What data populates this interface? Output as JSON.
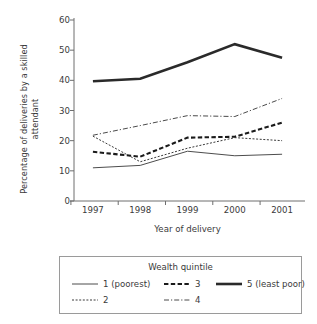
{
  "chart_data": {
    "type": "line",
    "title": "",
    "xlabel": "Year of delivery",
    "ylabel": "Percentage of deliveries by a skilled attendant",
    "ylabel_line1": "Percentage of deliveries by a skilled",
    "ylabel_line2": "attendant",
    "categories": [
      "1997",
      "1998",
      "1999",
      "2000",
      "2001"
    ],
    "x": [
      1997,
      1998,
      1999,
      2000,
      2001
    ],
    "xlim": [
      1996.6,
      2001.4
    ],
    "ylim": [
      0,
      60
    ],
    "yticks": [
      0,
      10,
      20,
      30,
      40,
      50,
      60
    ],
    "ytick_labels": [
      "0",
      "10",
      "20",
      "30",
      "40",
      "50",
      "60"
    ],
    "grid": false,
    "legend_position": "below",
    "legend_title": "Wealth quintile",
    "series": [
      {
        "name": "1 (poorest)",
        "key": "q1",
        "values": [
          11.0,
          11.8,
          16.5,
          15.0,
          15.5
        ],
        "style": "solid-thin",
        "color": "#4d4d4d",
        "width": 1.0
      },
      {
        "name": "2",
        "key": "q2",
        "values": [
          21.5,
          13.0,
          17.5,
          21.0,
          20.0
        ],
        "style": "dotted-fine",
        "color": "#3a3a3a",
        "width": 1.0
      },
      {
        "name": "3",
        "key": "q3",
        "values": [
          16.3,
          14.7,
          21.0,
          21.3,
          26.0
        ],
        "style": "dash-dot-thick",
        "color": "#1a1a1a",
        "width": 2.1
      },
      {
        "name": "4",
        "key": "q4",
        "values": [
          21.8,
          25.0,
          28.3,
          28.0,
          34.0
        ],
        "style": "dash-dot-thin",
        "color": "#4a4a4a",
        "width": 1.0
      },
      {
        "name": "5 (least poor)",
        "key": "q5",
        "values": [
          39.7,
          40.5,
          46.0,
          52.0,
          47.5
        ],
        "style": "solid-thick",
        "color": "#2a2a2a",
        "width": 2.6
      }
    ],
    "axis_color": "#6e6e6e",
    "background": "#ffffff"
  }
}
